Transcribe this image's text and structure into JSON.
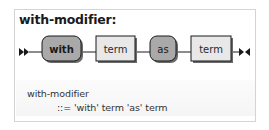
{
  "diagram": {
    "title": "with-modifier:",
    "start_marker": "double-arrow-right",
    "end_marker": "arrow-bowtie",
    "elements": [
      {
        "type": "terminal",
        "label": "with"
      },
      {
        "type": "nonterminal",
        "label": "term"
      },
      {
        "type": "terminal",
        "label": "as"
      },
      {
        "type": "nonterminal",
        "label": "term"
      }
    ],
    "colors": {
      "terminal_fill": "#a9a9a9",
      "nonterminal_fill": "#e8e8e8",
      "stroke": "#1a1a1a",
      "shadow": "#6a6a6a",
      "frame_border": "#d4d4d4"
    }
  },
  "grammar": {
    "rule_name": "with-modifier",
    "rule_body": "::= 'with' term 'as' term"
  }
}
